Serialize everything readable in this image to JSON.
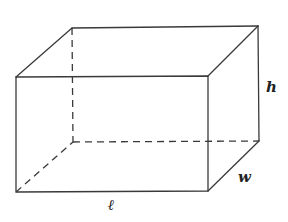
{
  "diagram": {
    "type": "rectangular-prism",
    "labels": {
      "height": "h",
      "width": "w",
      "length": "ℓ"
    },
    "colors": {
      "stroke": "#3a3a3a",
      "background": "#ffffff",
      "text": "#222222"
    },
    "vertices": {
      "front_top_left": [
        16,
        77
      ],
      "front_top_right": [
        208,
        76
      ],
      "front_bottom_left": [
        16,
        192
      ],
      "front_bottom_right": [
        208,
        191
      ],
      "back_top_left": [
        72,
        28
      ],
      "back_top_right": [
        258,
        26
      ],
      "back_bottom_left": [
        73,
        142
      ],
      "back_bottom_right": [
        259,
        141
      ]
    },
    "visible_edges": 9,
    "hidden_edges": 3
  }
}
